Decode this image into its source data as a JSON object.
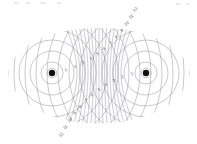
{
  "figure": {
    "width": 197,
    "height": 144,
    "background_color": "#ffffff",
    "wavefront_color": "#8d8a95",
    "nodal_line_color": "#8d8a95",
    "label_color": "#5a5860",
    "source_color": "#101010",
    "frame_visible": false
  },
  "sources": [
    {
      "name": "left-source",
      "label": "",
      "x": 52,
      "y": 73,
      "radius_px": 3.2,
      "wavelength_px": 11.0,
      "ring_count": 17
    },
    {
      "name": "right-source",
      "label": "",
      "x": 146,
      "y": 73,
      "radius_px": 3.2,
      "wavelength_px": 11.0,
      "ring_count": 17
    }
  ],
  "pattern": {
    "type": "two-source-interference",
    "separation_px": 94,
    "wavelength_px": 11.0,
    "nodal_line_count_per_side": 8,
    "envelope": {
      "shape": "lens",
      "left_x": 8,
      "right_x": 190,
      "top_y": 17,
      "bottom_y": 136,
      "center_y": 73
    }
  },
  "labels": {
    "upper_right_arc": {
      "description": "Numbers counting nodal lines ascending toward upper right",
      "values": [
        "1",
        "2",
        "3",
        "4",
        "5",
        "6",
        "7",
        "8",
        "9",
        "10",
        "11",
        "12",
        "13",
        "14",
        "15",
        "16",
        "17",
        "18",
        "19",
        "20"
      ]
    },
    "lower_left_arc": {
      "description": "Numbers counting nodal lines ascending toward lower left",
      "values": [
        "1",
        "2",
        "3",
        "4",
        "5",
        "6",
        "7",
        "8",
        "9",
        "10",
        "11",
        "12",
        "13",
        "14",
        "15",
        "16",
        "17",
        "18",
        "19",
        "20"
      ]
    },
    "right_inner": {
      "description": "Small numbers left of the right source",
      "values": [
        "1",
        "2",
        "3"
      ]
    },
    "left_inner": {
      "description": "Small numbers right of the left source",
      "values": [
        "1",
        "2",
        "3"
      ]
    },
    "font_size_px": 4.2
  },
  "artifacts": {
    "top_specks": [
      {
        "x": 14,
        "y": 2,
        "w": 5,
        "h": 2
      },
      {
        "x": 26,
        "y": 2,
        "w": 4,
        "h": 2
      },
      {
        "x": 40,
        "y": 2,
        "w": 6,
        "h": 2
      },
      {
        "x": 57,
        "y": 2,
        "w": 4,
        "h": 2
      },
      {
        "x": 176,
        "y": 3,
        "w": 4,
        "h": 2
      },
      {
        "x": 186,
        "y": 3,
        "w": 3,
        "h": 2
      }
    ]
  }
}
